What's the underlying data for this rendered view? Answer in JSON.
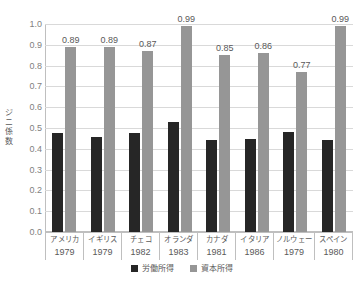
{
  "chart_data": {
    "type": "bar",
    "title": "",
    "xlabel": "",
    "ylabel": "ジニ係数",
    "ylim": [
      0.0,
      1.0
    ],
    "grid": true,
    "legend_position": "bottom",
    "categories": [
      "アメリカ",
      "イギリス",
      "チェコ",
      "オランダ",
      "カナダ",
      "イタリア",
      "ノルウェー",
      "スペイン"
    ],
    "category_years": [
      "1979",
      "1979",
      "1982",
      "1983",
      "1981",
      "1986",
      "1979",
      "1980"
    ],
    "series": [
      {
        "name": "労働所得",
        "color": "#262626",
        "values": [
          0.475,
          0.457,
          0.474,
          0.531,
          0.44,
          0.447,
          0.48,
          0.444
        ],
        "labels": [
          "",
          "",
          "",
          "",
          "",
          "",
          "",
          ""
        ]
      },
      {
        "name": "資本所得",
        "color": "#969696",
        "values": [
          0.89,
          0.89,
          0.87,
          0.99,
          0.85,
          0.86,
          0.77,
          0.99
        ],
        "labels": [
          "0.89",
          "0.89",
          "0.87",
          "0.99",
          "0.85",
          "0.86",
          "0.77",
          "0.99"
        ]
      }
    ],
    "ytick_labels": [
      "1.0",
      "0.9",
      "0.8",
      "0.7",
      "0.6",
      "0.5",
      "0.4",
      "0.3",
      "0.2",
      "0.1",
      "0.0"
    ],
    "ytick_values": [
      1.0,
      0.9,
      0.8,
      0.7,
      0.6,
      0.5,
      0.4,
      0.3,
      0.2,
      0.1,
      0.0
    ]
  },
  "legend": {
    "items": [
      {
        "label": "労働所得"
      },
      {
        "label": "資本所得"
      }
    ]
  }
}
